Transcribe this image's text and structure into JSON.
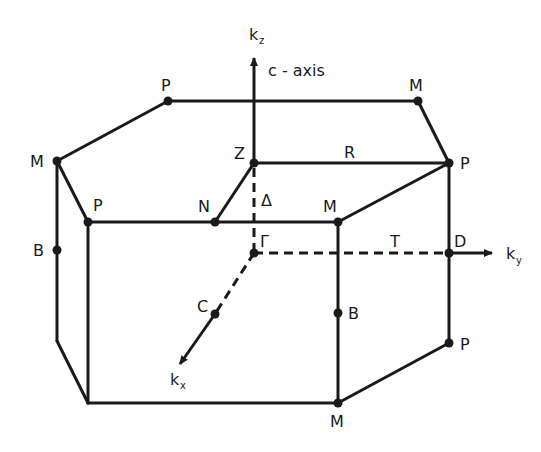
{
  "diagram": {
    "axes": {
      "kz": {
        "main": "k",
        "sub": "z"
      },
      "ky": {
        "main": "k",
        "sub": "y"
      },
      "kx": {
        "main": "k",
        "sub": "x"
      },
      "c_axis": "c - axis"
    },
    "points": {
      "P_top": "P",
      "M_top": "M",
      "M_left": "M",
      "Z": "Z",
      "R": "R",
      "P_right": "P",
      "P_front": "P",
      "N": "N",
      "Delta": "Δ",
      "M_front": "M",
      "B_left": "B",
      "Gamma": "Γ",
      "T": "T",
      "D": "D",
      "C": "C",
      "B_right": "B",
      "P_lower": "P",
      "M_bottom": "M"
    }
  }
}
